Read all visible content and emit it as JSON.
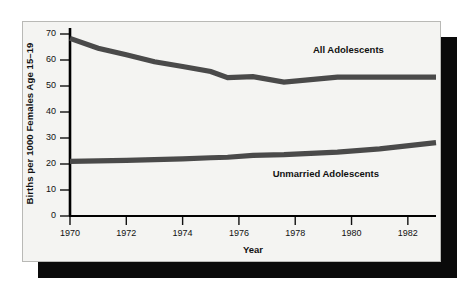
{
  "figure": {
    "background_color": "#ffffff",
    "panel_color": "#f4f4f2",
    "shadow_color": "#0a0a0a",
    "axis_color": "#000000",
    "line_color": "#4a4a4a"
  },
  "chart_data": {
    "type": "line",
    "title": "",
    "xlabel": "Year",
    "ylabel": "Births per 1000 Females Age 15–19",
    "xlim": [
      1970,
      1983
    ],
    "ylim": [
      0,
      74
    ],
    "grid": false,
    "legend_position": "inline-annotation",
    "xticks": [
      1970,
      1972,
      1974,
      1976,
      1978,
      1980,
      1982
    ],
    "xticklabels": [
      "1970",
      "1972",
      "1974",
      "1976",
      "1978",
      "1980",
      "1982"
    ],
    "yticks": [
      0,
      10,
      20,
      30,
      40,
      50,
      60,
      70
    ],
    "yticklabels": [
      "0",
      "10",
      "20",
      "30",
      "40",
      "50",
      "60",
      "70"
    ],
    "x": [
      1970,
      1971,
      1972,
      1973,
      1974,
      1975,
      1975.6,
      1976.5,
      1977.6,
      1979.5,
      1981,
      1983
    ],
    "series": [
      {
        "name": "All Adolescents",
        "label": "All Adolescents",
        "values": [
          68.3,
          64.5,
          62.0,
          59.3,
          57.5,
          55.6,
          53.2,
          53.6,
          51.5,
          53.4,
          53.4,
          53.4
        ],
        "label_x": 1979.0,
        "label_y": 64.0
      },
      {
        "name": "Unmarried Adolescents",
        "label": "Unmarried Adolescents",
        "values": [
          21.0,
          21.2,
          21.4,
          21.7,
          22.0,
          22.4,
          22.6,
          23.3,
          23.6,
          24.6,
          25.8,
          28.2
        ],
        "label_x": 1978.2,
        "label_y": 16.0
      }
    ]
  },
  "axis_titles": {
    "y": "Births per 1000 Females Age 15–19",
    "x": "Year"
  }
}
